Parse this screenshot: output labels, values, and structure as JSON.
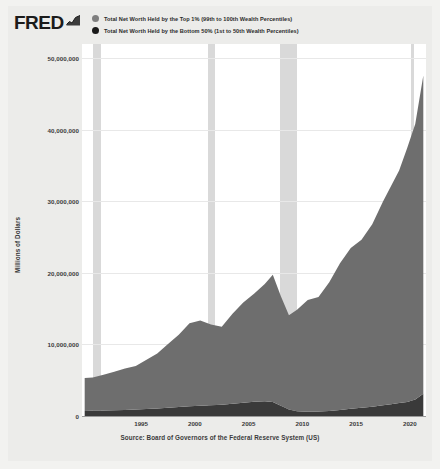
{
  "branding": {
    "wordmark": "FRED",
    "spark_icon": "sparkline-icon"
  },
  "legend": {
    "position": "top",
    "entries": [
      {
        "label": "Total Net Worth Held by the Top 1% (99th to 100th Wealth Percentiles)",
        "color": "#7f7f7f",
        "marker": "circle-marker"
      },
      {
        "label": "Total Net Worth Held by the Bottom 50% (1st to 50th Wealth Percentiles)",
        "color": "#1a1a1a",
        "marker": "circle-marker"
      }
    ]
  },
  "source": "Source: Board of Governors of the Federal Reserve System (US)",
  "chart_data": {
    "type": "area",
    "stacked": true,
    "title": "",
    "subtitle": "",
    "xlabel": "",
    "ylabel": "Millions of Dollars",
    "xlim": [
      1989.5,
      2021.5
    ],
    "ylim": [
      0,
      52000000
    ],
    "grid": true,
    "ytick_labels": [
      "0",
      "10,000,000",
      "20,000,000",
      "30,000,000",
      "40,000,000",
      "50,000,000"
    ],
    "ytick_values": [
      0,
      10000000,
      20000000,
      30000000,
      40000000,
      50000000
    ],
    "xtick_labels": [
      "1995",
      "2000",
      "2005",
      "2010",
      "2015",
      "2020"
    ],
    "xtick_values": [
      1995,
      2000,
      2005,
      2010,
      2015,
      2020
    ],
    "x": [
      1989.75,
      1990.5,
      1991.5,
      1992.5,
      1993.5,
      1994.5,
      1995.5,
      1996.5,
      1997.5,
      1998.5,
      1999.5,
      2000.5,
      2001.5,
      2002.5,
      2003.5,
      2004.5,
      2005.5,
      2006.5,
      2007.25,
      2008.0,
      2008.75,
      2009.5,
      2010.5,
      2011.5,
      2012.5,
      2013.5,
      2014.5,
      2015.5,
      2016.5,
      2017.5,
      2018.25,
      2019.0,
      2019.75,
      2020.5,
      2021.25
    ],
    "series": [
      {
        "name": "Total Net Worth Held by the Bottom 50% (1st to 50th Wealth Percentiles)",
        "color": "#3a3a3a",
        "values": [
          700000,
          720000,
          760000,
          800000,
          850000,
          900000,
          980000,
          1050000,
          1150000,
          1250000,
          1350000,
          1450000,
          1500000,
          1560000,
          1700000,
          1850000,
          2000000,
          2050000,
          1950000,
          1450000,
          900000,
          650000,
          600000,
          620000,
          700000,
          850000,
          1000000,
          1150000,
          1300000,
          1500000,
          1650000,
          1800000,
          1950000,
          2300000,
          3100000
        ]
      },
      {
        "name": "Total Net Worth Held by the Top 1% (99th to 100th Wealth Percentiles)",
        "color": "#6e6e6e",
        "values": [
          4600000,
          4650000,
          5000000,
          5400000,
          5800000,
          6100000,
          6900000,
          7700000,
          8900000,
          10100000,
          11600000,
          11900000,
          11300000,
          10900000,
          12600000,
          14000000,
          15100000,
          16400000,
          17800000,
          15300000,
          13200000,
          14200000,
          15600000,
          16000000,
          18000000,
          20500000,
          22500000,
          23500000,
          25500000,
          28500000,
          30500000,
          32500000,
          35500000,
          38500000,
          44500000
        ]
      }
    ],
    "recessions": [
      {
        "start": 1990.5,
        "end": 1991.25
      },
      {
        "start": 2001.25,
        "end": 2001.9
      },
      {
        "start": 2007.95,
        "end": 2009.5
      },
      {
        "start": 2020.1,
        "end": 2020.4
      }
    ],
    "recession_color": "#d9d9d9"
  }
}
